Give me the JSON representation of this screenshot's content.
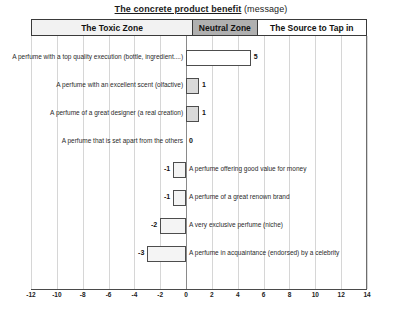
{
  "title": {
    "underlined": "The concrete product benefit",
    "suffix": " (message)"
  },
  "zones": [
    {
      "label": "The Toxic Zone",
      "style": "dotted"
    },
    {
      "label": "Neutral Zone",
      "style": "gray"
    },
    {
      "label": "The Source to Tap in",
      "style": "white"
    }
  ],
  "axis": {
    "ticks": [
      "-12",
      "-10",
      "-8",
      "-6",
      "-4",
      "-2",
      "0",
      "2",
      "4",
      "6",
      "8",
      "10",
      "12",
      "14"
    ]
  },
  "chart_data": {
    "type": "bar",
    "orientation": "horizontal",
    "title": "The concrete product benefit (message)",
    "xlabel": "",
    "ylabel": "",
    "xlim": [
      -12,
      14
    ],
    "xticks": [
      -12,
      -10,
      -8,
      -6,
      -4,
      -2,
      0,
      2,
      4,
      6,
      8,
      10,
      12,
      14
    ],
    "grid": true,
    "zones": [
      {
        "name": "The Toxic Zone",
        "range": [
          -12,
          0
        ]
      },
      {
        "name": "Neutral Zone",
        "range": [
          0,
          5
        ]
      },
      {
        "name": "The Source to Tap in",
        "range": [
          5,
          14
        ]
      }
    ],
    "categories": [
      "A perfume with a top quality execution (bottle, ingredient....)",
      "A perfume with an excellent scent (olfactive)",
      "A perfume of a great designer (a real creation)",
      "A perfume that is set apart from the others",
      "A perfume offering good value for money",
      "A perfume of a great renown brand",
      "A very exclusive perfume (niche)",
      "A perfume in acquaintance (endorsed) by a celebrity"
    ],
    "values": [
      5,
      1,
      1,
      0,
      -1,
      -1,
      -2,
      -3
    ]
  },
  "bars": [
    {
      "label": "A perfume with a top quality execution (bottle, ingredient....)",
      "value": 5,
      "value_text": "5"
    },
    {
      "label": "A perfume with an excellent scent (olfactive)",
      "value": 1,
      "value_text": "1"
    },
    {
      "label": "A perfume of a great designer (a real creation)",
      "value": 1,
      "value_text": "1"
    },
    {
      "label": "A perfume that is set apart from the others",
      "value": 0,
      "value_text": "0"
    },
    {
      "label": "A perfume offering good value for money",
      "value": -1,
      "value_text": "-1"
    },
    {
      "label": "A perfume of a great renown brand",
      "value": -1,
      "value_text": "-1"
    },
    {
      "label": "A very exclusive perfume (niche)",
      "value": -2,
      "value_text": "-2"
    },
    {
      "label": "A perfume in acquaintance (endorsed) by a celebrity",
      "value": -3,
      "value_text": "-3"
    }
  ]
}
